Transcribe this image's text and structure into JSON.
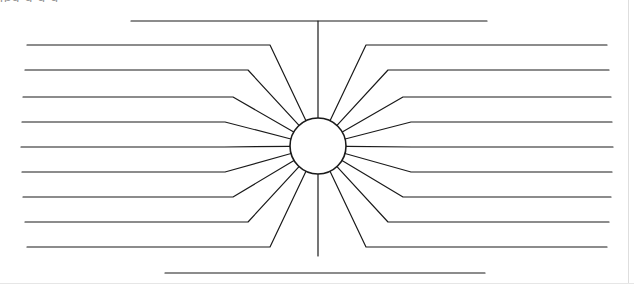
{
  "page": {
    "width": 634,
    "height": 284,
    "background_color": "#ffffff",
    "stroke_color": "#1a1a1a",
    "stroke_width": 1.2,
    "border_color": "#d8d8d8",
    "clipped_header_text": "jpg g g g"
  },
  "center_node": {
    "name": "center-circle",
    "label": "",
    "cx": 318,
    "cy": 146,
    "r": 28,
    "fill": "#ffffff",
    "stroke": "#1a1a1a",
    "stroke_width": 1.6
  },
  "spokes": {
    "total": 20,
    "left_count": 9,
    "right_count": 9,
    "vertical_count": 2,
    "description": "Blank write-on lines radiating from a central circle"
  },
  "vertical_spokes": [
    {
      "name": "spoke-top",
      "side": "top",
      "index": 0,
      "stem": {
        "x": 318,
        "y1": 21,
        "y2": 118
      },
      "write_line": {
        "x1": 131,
        "x2": 487,
        "y": 21
      },
      "label": ""
    },
    {
      "name": "spoke-bottom",
      "side": "bottom",
      "index": 0,
      "stem": {
        "x": 318,
        "y1": 174,
        "y2": 256
      },
      "write_line": {
        "x1": 165,
        "x2": 485,
        "y": 273
      },
      "label": ""
    }
  ],
  "left_spokes": [
    {
      "name": "spoke-left-1",
      "index": 1,
      "line_y": 45,
      "line_x1": 27,
      "bend_x": 270,
      "label": ""
    },
    {
      "name": "spoke-left-2",
      "index": 2,
      "line_y": 70,
      "line_x1": 25,
      "bend_x": 248,
      "label": ""
    },
    {
      "name": "spoke-left-3",
      "index": 3,
      "line_y": 97,
      "line_x1": 23,
      "bend_x": 233,
      "label": ""
    },
    {
      "name": "spoke-left-4",
      "index": 4,
      "line_y": 122,
      "line_x1": 22,
      "bend_x": 225,
      "label": ""
    },
    {
      "name": "spoke-left-5",
      "index": 5,
      "line_y": 147,
      "line_x1": 21,
      "bend_x": 224,
      "label": ""
    },
    {
      "name": "spoke-left-6",
      "index": 6,
      "line_y": 172,
      "line_x1": 22,
      "bend_x": 225,
      "label": ""
    },
    {
      "name": "spoke-left-7",
      "index": 7,
      "line_y": 197,
      "line_x1": 23,
      "bend_x": 233,
      "label": ""
    },
    {
      "name": "spoke-left-8",
      "index": 8,
      "line_y": 222,
      "line_x1": 25,
      "bend_x": 248,
      "label": ""
    },
    {
      "name": "spoke-left-9",
      "index": 9,
      "line_y": 247,
      "line_x1": 27,
      "bend_x": 270,
      "label": ""
    }
  ],
  "right_spokes": [
    {
      "name": "spoke-right-1",
      "index": 1,
      "line_y": 45,
      "line_x2": 607,
      "bend_x": 366,
      "label": ""
    },
    {
      "name": "spoke-right-2",
      "index": 2,
      "line_y": 70,
      "line_x2": 609,
      "bend_x": 388,
      "label": ""
    },
    {
      "name": "spoke-right-3",
      "index": 3,
      "line_y": 97,
      "line_x2": 611,
      "bend_x": 403,
      "label": ""
    },
    {
      "name": "spoke-right-4",
      "index": 4,
      "line_y": 122,
      "line_x2": 612,
      "bend_x": 411,
      "label": ""
    },
    {
      "name": "spoke-right-5",
      "index": 5,
      "line_y": 147,
      "line_x2": 613,
      "bend_x": 412,
      "label": ""
    },
    {
      "name": "spoke-right-6",
      "index": 6,
      "line_y": 172,
      "line_x2": 612,
      "bend_x": 411,
      "label": ""
    },
    {
      "name": "spoke-right-7",
      "index": 7,
      "line_y": 197,
      "line_x2": 611,
      "bend_x": 403,
      "label": ""
    },
    {
      "name": "spoke-right-8",
      "index": 8,
      "line_y": 222,
      "line_x2": 609,
      "bend_x": 388,
      "label": ""
    },
    {
      "name": "spoke-right-9",
      "index": 9,
      "line_y": 247,
      "line_x2": 607,
      "bend_x": 366,
      "label": ""
    }
  ]
}
